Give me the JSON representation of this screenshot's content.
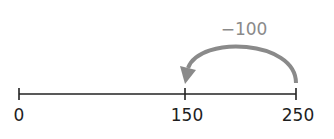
{
  "number_line": {
    "ticks": [
      {
        "value": "0",
        "x": 19
      },
      {
        "value": "150",
        "x": 185
      },
      {
        "value": "250",
        "x": 296
      }
    ],
    "line_color": "#222222"
  },
  "jump": {
    "label": "−100",
    "from": "250",
    "to": "150",
    "color": "#8a8a8a"
  }
}
